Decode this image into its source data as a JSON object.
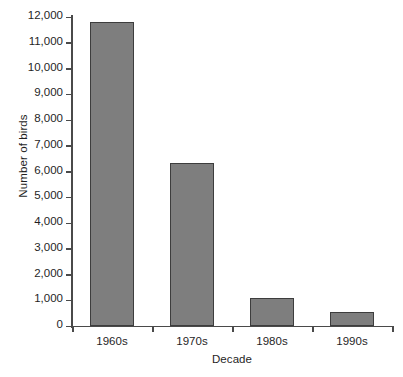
{
  "chart_data": {
    "type": "bar",
    "title": "",
    "xlabel": "Decade",
    "ylabel": "Number of birds",
    "categories": [
      "1960s",
      "1970s",
      "1980s",
      "1990s"
    ],
    "values": [
      11800,
      6350,
      1080,
      560
    ],
    "ylim": [
      0,
      12000
    ],
    "ytick_values": [
      0,
      1000,
      2000,
      3000,
      4000,
      5000,
      6000,
      7000,
      8000,
      9000,
      10000,
      11000,
      12000
    ],
    "ytick_labels": [
      "0",
      "1,000",
      "2,000",
      "3,000",
      "4,000",
      "5,000",
      "6,000",
      "7,000",
      "8,000",
      "9,000",
      "10,000",
      "11,000",
      "12,000"
    ],
    "grid": false,
    "legend": false,
    "legend_position": "none",
    "series": [
      {
        "name": "Number of birds",
        "values": [
          11800,
          6350,
          1080,
          560
        ]
      }
    ],
    "colors": {
      "bar_fill": "#7e7e7e",
      "bar_border": "#3d3d3d",
      "axis": "#4a4a4a",
      "text": "#1f1f1f",
      "background": "#ffffff"
    }
  }
}
